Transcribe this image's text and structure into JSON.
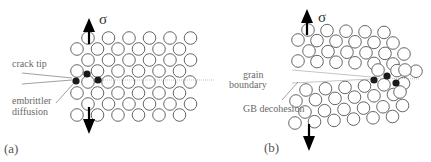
{
  "figure": {
    "panels": [
      {
        "id": "a",
        "label": "(a)",
        "stress_symbol": "σ",
        "annotations": {
          "crack_tip": "crack tip",
          "embrittler_line1": "embrittler",
          "embrittler_line2": "diffusion"
        }
      },
      {
        "id": "b",
        "label": "(b)",
        "stress_symbol": "σ",
        "annotations": {
          "grain_line1": "grain",
          "grain_line2": "boundary",
          "gb_decohesion": "GB decohesion"
        }
      }
    ]
  },
  "colors": {
    "atom_stroke": "#666666",
    "solute_fill": "#1a1a1a",
    "label_text": "#6a6a6a",
    "arrow": "#000000"
  }
}
